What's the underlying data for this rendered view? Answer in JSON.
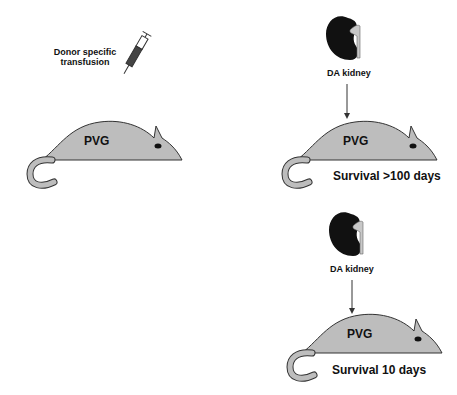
{
  "panels": {
    "left": {
      "treatment_label_line1": "Donor specific",
      "treatment_label_line2": "transfusion",
      "animal_label": "PVG",
      "icon": "syringe-icon"
    },
    "right_top": {
      "organ_label": "DA kidney",
      "animal_label": "PVG",
      "outcome_label": "Survival  >100 days",
      "icon": "kidney-icon"
    },
    "right_bottom": {
      "organ_label": "DA kidney",
      "animal_label": "PVG",
      "outcome_label": "Survival  10 days",
      "icon": "kidney-icon"
    }
  },
  "colors": {
    "rat_fill": "#bdbdbd",
    "kidney_fill": "#111111",
    "outline": "#222222"
  }
}
